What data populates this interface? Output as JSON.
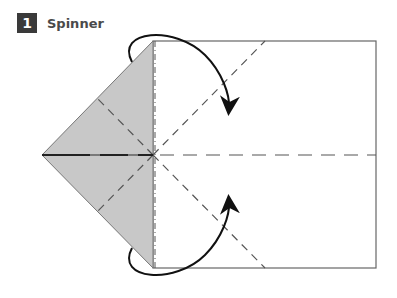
{
  "step": {
    "number": "1",
    "title": "Spinner"
  },
  "diagram": {
    "colors": {
      "paper_front": "#ffffff",
      "paper_back": "#c8c8c8",
      "outline": "#555555",
      "arrow": "#111111"
    }
  }
}
